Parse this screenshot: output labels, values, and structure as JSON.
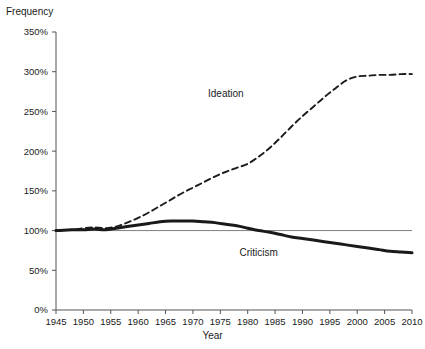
{
  "chart_data": {
    "type": "line",
    "title": "",
    "xlabel": "Year",
    "ylabel": "Frequency",
    "xlim": [
      1945,
      2010
    ],
    "ylim": [
      0,
      350
    ],
    "xticks": [
      1945,
      1950,
      1955,
      1960,
      1965,
      1970,
      1975,
      1980,
      1985,
      1990,
      1995,
      2000,
      2005,
      2010
    ],
    "xtick_labels": [
      "1945",
      "1950",
      "1955",
      "1960",
      "1965",
      "1970",
      "1975",
      "1980",
      "1985",
      "1990",
      "1995",
      "2000",
      "2005",
      "2010"
    ],
    "yticks": [
      0,
      50,
      100,
      150,
      200,
      250,
      300,
      350
    ],
    "ytick_labels": [
      "0%",
      "50%",
      "100%",
      "150%",
      "200%",
      "250%",
      "300%",
      "350%"
    ],
    "grid": false,
    "legend": "inline-annotations",
    "reference_line": {
      "value": 100,
      "color": "#808080"
    },
    "series": [
      {
        "name": "Ideation",
        "style": "dashed",
        "color": "#1a1a1a",
        "label_x": 1976,
        "label_y": 268,
        "x": [
          1945,
          1948,
          1950,
          1952,
          1954,
          1956,
          1958,
          1960,
          1962,
          1964,
          1966,
          1968,
          1970,
          1972,
          1974,
          1976,
          1978,
          1980,
          1982,
          1984,
          1986,
          1988,
          1990,
          1992,
          1994,
          1996,
          1998,
          2000,
          2002,
          2004,
          2006,
          2008,
          2010
        ],
        "y": [
          100,
          101,
          103,
          104,
          103,
          105,
          110,
          116,
          123,
          131,
          139,
          147,
          154,
          161,
          168,
          174,
          179,
          184,
          193,
          204,
          217,
          231,
          244,
          256,
          268,
          279,
          289,
          294,
          295,
          296,
          296,
          297,
          297
        ]
      },
      {
        "name": "Criticism",
        "style": "solid",
        "color": "#1a1a1a",
        "label_x": 1982,
        "label_y": 68,
        "x": [
          1945,
          1948,
          1950,
          1952,
          1954,
          1956,
          1958,
          1960,
          1962,
          1964,
          1966,
          1968,
          1970,
          1972,
          1974,
          1976,
          1978,
          1980,
          1982,
          1984,
          1986,
          1988,
          1990,
          1992,
          1994,
          1996,
          1998,
          2000,
          2002,
          2004,
          2006,
          2008,
          2010
        ],
        "y": [
          100,
          101,
          101,
          102,
          101,
          103,
          105,
          107,
          109,
          111,
          112,
          112,
          112,
          111,
          110,
          108,
          106,
          103,
          100,
          98,
          95,
          92,
          90,
          88,
          86,
          84,
          82,
          80,
          78,
          76,
          74,
          73,
          72
        ]
      }
    ]
  }
}
